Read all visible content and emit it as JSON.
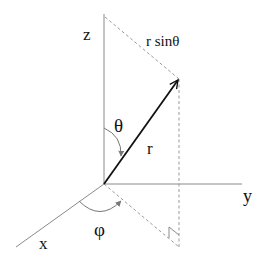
{
  "diagram": {
    "labels": {
      "z": "z",
      "y": "y",
      "x": "x",
      "theta": "θ",
      "phi": "φ",
      "r": "r",
      "r_sin_theta": "r sinθ"
    },
    "colors": {
      "axis": "#8a8a8a",
      "vector": "#111111",
      "dashed": "#9a9a9a",
      "background": "#ffffff"
    },
    "elements": [
      "z-axis",
      "y-axis",
      "x-axis",
      "radius-vector-r",
      "theta-arc",
      "phi-arc",
      "projection-line",
      "vertical-drop-line",
      "r-sin-theta-line",
      "right-angle-marker"
    ]
  }
}
